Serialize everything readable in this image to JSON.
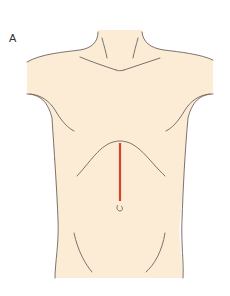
{
  "figure": {
    "panel_label": "A",
    "annotations": [
      {
        "name": "upper-midline-incision",
        "type": "incision-line",
        "color": "#d2452a"
      },
      {
        "name": "umbilicus",
        "type": "anatomical-landmark"
      }
    ]
  },
  "colors": {
    "skin": "#fcecd6",
    "outline": "#6b6460",
    "incision": "#d2452a",
    "background": "#ffffff"
  }
}
